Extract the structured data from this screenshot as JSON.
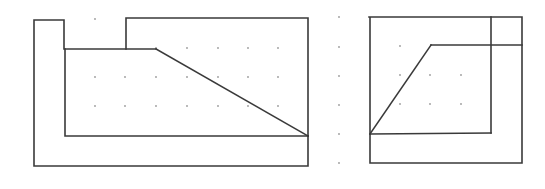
{
  "diagram": {
    "type": "orthographic-views",
    "colors": {
      "background": "#ffffff",
      "line": "#3a3a3a",
      "grid_dot": "#9a9a9a"
    },
    "line_width": 1.6,
    "grid": {
      "dot_radius": 0.9,
      "columns_x": [
        95,
        125,
        156,
        187,
        218,
        248,
        278,
        339,
        400,
        430,
        461
      ],
      "rows_y": [
        19,
        48,
        77,
        106,
        135,
        164
      ]
    },
    "views": [
      {
        "name": "front-view",
        "polylines": [
          {
            "name": "outer-l-bracket",
            "points": [
              [
                64,
                49
              ],
              [
                64,
                20
              ],
              [
                34,
                20
              ],
              [
                34,
                166
              ],
              [
                308,
                166
              ],
              [
                308,
                136
              ]
            ]
          },
          {
            "name": "inner-bottom-edge",
            "points": [
              [
                65,
                49
              ],
              [
                65,
                136
              ],
              [
                308,
                136
              ]
            ]
          },
          {
            "name": "top-ledge-edge",
            "points": [
              [
                65,
                49
              ],
              [
                156,
                49
              ]
            ]
          },
          {
            "name": "sloped-face-edge",
            "points": [
              [
                156,
                49
              ],
              [
                308,
                136
              ]
            ]
          },
          {
            "name": "raised-block-outline",
            "points": [
              [
                126,
                49
              ],
              [
                126,
                18
              ],
              [
                308,
                18
              ],
              [
                308,
                136
              ]
            ]
          }
        ]
      },
      {
        "name": "side-view",
        "polylines": [
          {
            "name": "outer-boundary",
            "points": [
              [
                369,
                17
              ],
              [
                522,
                17
              ],
              [
                522,
                163
              ],
              [
                370,
                163
              ],
              [
                370,
                17
              ]
            ]
          },
          {
            "name": "inner-vertical-edge",
            "points": [
              [
                491,
                17
              ],
              [
                491,
                133
              ]
            ]
          },
          {
            "name": "inner-bottom-edge",
            "points": [
              [
                370,
                134
              ],
              [
                491,
                133
              ]
            ]
          },
          {
            "name": "sloped-face-edge",
            "points": [
              [
                370,
                134
              ],
              [
                431,
                45
              ]
            ]
          },
          {
            "name": "top-ledge-edge",
            "points": [
              [
                431,
                45
              ],
              [
                522,
                45
              ]
            ]
          }
        ]
      }
    ],
    "dots": [
      [
        95,
        19
      ],
      [
        156,
        48
      ],
      [
        187,
        48
      ],
      [
        218,
        48
      ],
      [
        248,
        48
      ],
      [
        278,
        48
      ],
      [
        95,
        77
      ],
      [
        125,
        77
      ],
      [
        156,
        77
      ],
      [
        187,
        77
      ],
      [
        218,
        77
      ],
      [
        248,
        77
      ],
      [
        278,
        77
      ],
      [
        95,
        106
      ],
      [
        125,
        106
      ],
      [
        156,
        106
      ],
      [
        187,
        106
      ],
      [
        218,
        106
      ],
      [
        248,
        106
      ],
      [
        278,
        106
      ],
      [
        339,
        17
      ],
      [
        339,
        47
      ],
      [
        339,
        76
      ],
      [
        339,
        105
      ],
      [
        339,
        134
      ],
      [
        339,
        163
      ],
      [
        400,
        46
      ],
      [
        400,
        75
      ],
      [
        430,
        75
      ],
      [
        461,
        75
      ],
      [
        400,
        104
      ],
      [
        430,
        104
      ],
      [
        461,
        104
      ]
    ]
  }
}
